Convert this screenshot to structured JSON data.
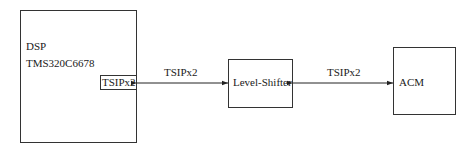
{
  "diagram": {
    "nodes": [
      {
        "id": "dsp",
        "label_line1": "DSP",
        "label_line2": "TMS320C6678",
        "port_label": "TSIPx2"
      },
      {
        "id": "level_shifter",
        "label": "Level-Shifter"
      },
      {
        "id": "acm",
        "label": "ACM"
      }
    ],
    "edges": [
      {
        "from": "dsp",
        "to": "level_shifter",
        "label": "TSIPx2",
        "direction": "bidirectional"
      },
      {
        "from": "level_shifter",
        "to": "acm",
        "label": "TSIPx2",
        "direction": "bidirectional"
      }
    ]
  }
}
